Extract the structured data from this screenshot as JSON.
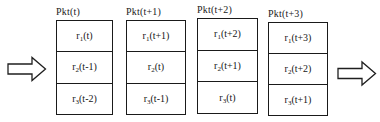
{
  "diagram": {
    "type": "packet-pipeline-diagram",
    "background_color": "#ffffff",
    "line_color": "#1a1a1a",
    "input_arrow": {
      "name": "input-arrow",
      "direction": "right"
    },
    "output_arrow": {
      "name": "output-arrow",
      "direction": "right"
    },
    "packets": [
      {
        "label": "Pkt(t)",
        "cells": [
          {
            "symbol": "r",
            "subscript": "1",
            "argument": "(t)"
          },
          {
            "symbol": "r",
            "subscript": "2",
            "argument": "(t-1)"
          },
          {
            "symbol": "r",
            "subscript": "3",
            "argument": "(t-2)"
          }
        ]
      },
      {
        "label": "Pkt(t+1)",
        "cells": [
          {
            "symbol": "r",
            "subscript": "1",
            "argument": "(t+1)"
          },
          {
            "symbol": "r",
            "subscript": "2",
            "argument": "(t)"
          },
          {
            "symbol": "r",
            "subscript": "3",
            "argument": "(t-1)"
          }
        ]
      },
      {
        "label": "Pkt(t+2)",
        "cells": [
          {
            "symbol": "r",
            "subscript": "1",
            "argument": "(t+2)"
          },
          {
            "symbol": "r",
            "subscript": "2",
            "argument": "(t+1)"
          },
          {
            "symbol": "r",
            "subscript": "3",
            "argument": "(t)"
          }
        ]
      },
      {
        "label": "Pkt(t+3)",
        "cells": [
          {
            "symbol": "r",
            "subscript": "1",
            "argument": "(t+3)"
          },
          {
            "symbol": "r",
            "subscript": "2",
            "argument": "(t+2)"
          },
          {
            "symbol": "r",
            "subscript": "3",
            "argument": "(t+1)"
          }
        ]
      }
    ]
  }
}
